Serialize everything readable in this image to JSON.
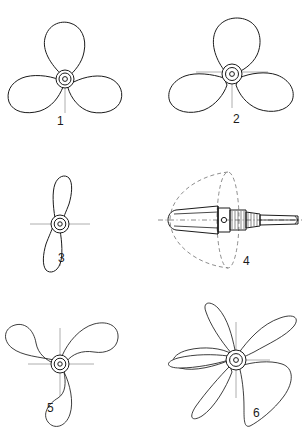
{
  "plate": {
    "kind": "technical-line-drawing",
    "subject": "marine screw propeller types",
    "top_caption_text": "",
    "background_color": "#ffffff",
    "line_color": "#1b1b1b",
    "centerline_color": "#9a9a9a",
    "figure_count": 6
  },
  "figures": [
    {
      "id": "fig-1",
      "label": "1",
      "label_x": 57,
      "label_y": 120,
      "blades": 3,
      "view": "face-on",
      "description": "three-bladed propeller, narrow pear-shaped blades, one blade pointing up"
    },
    {
      "id": "fig-2",
      "label": "2",
      "label_x": 233,
      "label_y": 118,
      "blades": 3,
      "view": "face-on",
      "description": "three-bladed propeller, broad rounded blades, crosshair centerlines"
    },
    {
      "id": "fig-3",
      "label": "3",
      "label_x": 58,
      "label_y": 257,
      "blades": 2,
      "view": "face-on",
      "description": "two-bladed propeller, narrow vertical blades"
    },
    {
      "id": "fig-4",
      "label": "4",
      "label_x": 243,
      "label_y": 260,
      "blades": 0,
      "view": "side-elevation",
      "description": "side view of hub cone on threaded tail shaft with dashed swept-circle outline"
    },
    {
      "id": "fig-5",
      "label": "5",
      "label_x": 47,
      "label_y": 407,
      "blades": 3,
      "view": "face-on",
      "description": "three-bladed propeller with curved swept-back scimitar blades"
    },
    {
      "id": "fig-6",
      "label": "6",
      "label_x": 253,
      "label_y": 412,
      "blades": 3,
      "view": "oblique",
      "description": "three-bladed propeller drawn in perspective with sharp pointed blade tips"
    }
  ]
}
